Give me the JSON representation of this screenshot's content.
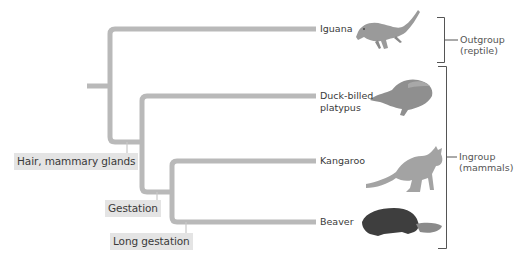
{
  "diagram": {
    "type": "cladogram",
    "colors": {
      "branch": "#b9b9b9",
      "trait_bg": "#e4e4e4",
      "bracket": "#555555",
      "text": "#3a3a3a"
    },
    "taxa": [
      {
        "id": "iguana",
        "label": "Iguana",
        "image": "iguana-illustration"
      },
      {
        "id": "platypus",
        "label": "Duck-billed platypus",
        "line1": "Duck-billed",
        "line2": "platypus",
        "image": "platypus-illustration"
      },
      {
        "id": "kangaroo",
        "label": "Kangaroo",
        "image": "kangaroo-illustration"
      },
      {
        "id": "beaver",
        "label": "Beaver",
        "image": "beaver-illustration"
      }
    ],
    "traits": [
      {
        "id": "hair",
        "label": "Hair, mammary glands"
      },
      {
        "id": "gestation",
        "label": "Gestation"
      },
      {
        "id": "long_gestation",
        "label": "Long gestation"
      }
    ],
    "groups": [
      {
        "id": "outgroup",
        "line1": "Outgroup",
        "line2": "(reptile)"
      },
      {
        "id": "ingroup",
        "line1": "Ingroup",
        "line2": "(mammals)"
      }
    ]
  }
}
